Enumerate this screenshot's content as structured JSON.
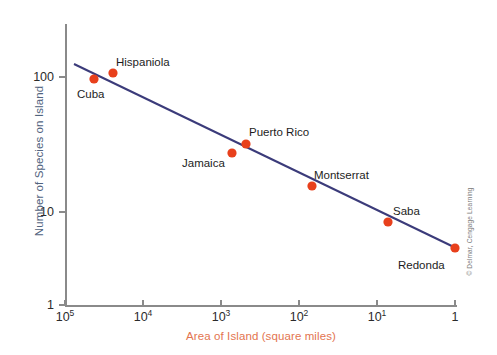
{
  "chart_data": {
    "type": "scatter",
    "title": "",
    "xlabel": "Area of Island (square miles)",
    "ylabel": "Number of Species on Island",
    "xscale": "log",
    "yscale": "log",
    "x_axis_reversed": true,
    "xlim": [
      100000,
      1
    ],
    "ylim": [
      1,
      200
    ],
    "xticks": [
      {
        "label": "10",
        "exp": "5",
        "value": 100000
      },
      {
        "label": "10",
        "exp": "4",
        "value": 10000
      },
      {
        "label": "10",
        "exp": "3",
        "value": 1000
      },
      {
        "label": "10",
        "exp": "2",
        "value": 100
      },
      {
        "label": "10",
        "exp": "1",
        "value": 10
      },
      {
        "label": "1",
        "exp": "",
        "value": 1
      }
    ],
    "yticks": [
      {
        "label": "100",
        "value": 100
      },
      {
        "label": "10",
        "value": 10
      },
      {
        "label": "1",
        "value": 1
      }
    ],
    "grid": false,
    "legend": "none",
    "point_color": "#e8401c",
    "line_color": "#3b3b7a",
    "points": [
      {
        "name": "Cuba",
        "area": 44200,
        "species": 92,
        "px": 94,
        "py": 79,
        "label_x": 77,
        "label_y": 89
      },
      {
        "name": "Hispaniola",
        "area": 29400,
        "species": 102,
        "px": 113,
        "py": 73,
        "label_x": 116,
        "label_y": 57
      },
      {
        "name": "Jamaica",
        "area": 1500,
        "species": 29,
        "px": 232,
        "py": 153,
        "label_x": 182,
        "label_y": 158
      },
      {
        "name": "Puerto Rico",
        "area": 930,
        "species": 36,
        "px": 246,
        "py": 144,
        "label_x": 249,
        "label_y": 127
      },
      {
        "name": "Montserrat",
        "area": 150,
        "species": 18,
        "px": 312,
        "py": 186,
        "label_x": 314,
        "label_y": 170
      },
      {
        "name": "Saba",
        "area": 13,
        "species": 9.5,
        "px": 388,
        "py": 222,
        "label_x": 393,
        "label_y": 206
      },
      {
        "name": "Redonda",
        "area": 1,
        "species": 5,
        "px": 455,
        "py": 248,
        "label_x": 398,
        "label_y": 260
      }
    ],
    "trend_line": {
      "x1": 74,
      "y1": 64,
      "x2": 458,
      "y2": 249,
      "description": "species-area regression line"
    }
  },
  "credit": {
    "text": "© Delmar, Cengage Learning"
  }
}
